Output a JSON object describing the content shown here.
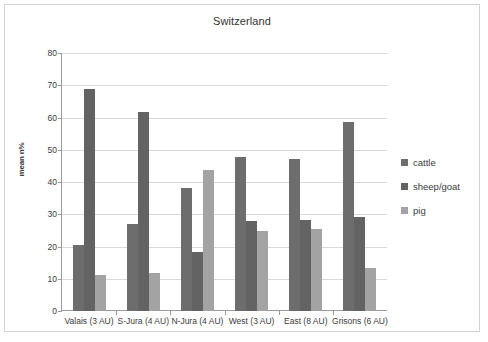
{
  "chart_data": {
    "type": "bar",
    "title": "Switzerland",
    "xlabel": "",
    "ylabel": "mean n%",
    "ylim": [
      0,
      80
    ],
    "yticks": [
      0,
      10,
      20,
      30,
      40,
      50,
      60,
      70,
      80
    ],
    "grid": true,
    "legend_position": "right",
    "categories": [
      "Valais (3 AU)",
      "S-Jura (4 AU)",
      "N-Jura (4 AU)",
      "West (3 AU)",
      "East (8 AU)",
      "Grisons (6 AU)"
    ],
    "series": [
      {
        "name": "cattle",
        "color": "#6d6d6d",
        "values": [
          20.4,
          26.9,
          38.2,
          47.8,
          47.0,
          58.5
        ]
      },
      {
        "name": "sheep/goat",
        "color": "#636363",
        "values": [
          68.7,
          61.6,
          18.4,
          27.9,
          28.2,
          29.2
        ]
      },
      {
        "name": "pig",
        "color": "#a3a3a3",
        "values": [
          11.1,
          11.7,
          43.6,
          24.8,
          25.4,
          13.3
        ]
      }
    ]
  },
  "legend": {
    "items": [
      {
        "label": "cattle"
      },
      {
        "label": "sheep/goat"
      },
      {
        "label": "pig"
      }
    ]
  }
}
